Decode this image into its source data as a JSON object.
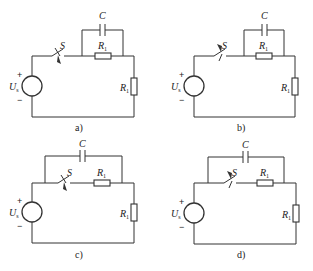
{
  "figure": {
    "panels": [
      {
        "id": "a",
        "caption": "a)",
        "capacitor_label": "C",
        "capacitor_parallel_with": "R1 only",
        "switch_label": "S",
        "switch_arrow": "down",
        "series_resistor_label": "R",
        "series_resistor_sub": "1",
        "load_resistor_label": "R",
        "load_resistor_sub": "1",
        "source_label": "U",
        "source_sub": "s",
        "plus": "+",
        "minus": "−"
      },
      {
        "id": "b",
        "caption": "b)",
        "capacitor_label": "C",
        "capacitor_parallel_with": "R1 only",
        "switch_label": "S",
        "switch_arrow": "up",
        "series_resistor_label": "R",
        "series_resistor_sub": "1",
        "load_resistor_label": "R",
        "load_resistor_sub": "1",
        "source_label": "U",
        "source_sub": "s",
        "plus": "+",
        "minus": "−"
      },
      {
        "id": "c",
        "caption": "c)",
        "capacitor_label": "C",
        "capacitor_parallel_with": "S and R1",
        "switch_label": "S",
        "switch_arrow": "down",
        "series_resistor_label": "R",
        "series_resistor_sub": "1",
        "load_resistor_label": "R",
        "load_resistor_sub": "1",
        "source_label": "U",
        "source_sub": "s",
        "plus": "+",
        "minus": "−"
      },
      {
        "id": "d",
        "caption": "d)",
        "capacitor_label": "C",
        "capacitor_parallel_with": "S and R1",
        "switch_label": "S",
        "switch_arrow": "up",
        "series_resistor_label": "R",
        "series_resistor_sub": "1",
        "load_resistor_label": "R",
        "load_resistor_sub": "1",
        "source_label": "U",
        "source_sub": "s",
        "plus": "+",
        "minus": "−"
      }
    ]
  }
}
